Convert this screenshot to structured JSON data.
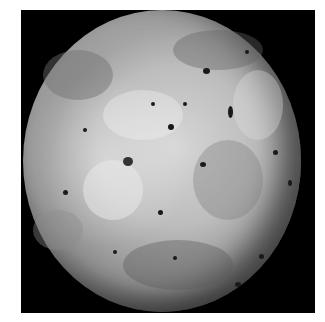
{
  "image": {
    "subject": "cratered grey moon globe on black background",
    "background_color": "#000000",
    "page_color": "#ffffff"
  },
  "caption": {
    "text": ""
  }
}
